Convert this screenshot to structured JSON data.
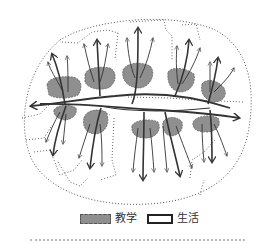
{
  "diagram": {
    "type": "campus-zoning-flow-diagram",
    "colors": {
      "teaching_fill": "#8f8f8f",
      "teaching_stroke": "#666666",
      "arrow": "#333333",
      "dotted_boundary": "#555555",
      "background": "#ffffff"
    },
    "outer_boundary": {
      "cx": 136,
      "cy": 112,
      "rx": 114,
      "ry": 94,
      "style": "dotted"
    },
    "teaching_zones": [
      {
        "id": "upper-1",
        "cx": 63,
        "cy": 87,
        "rx": 17,
        "ry": 10
      },
      {
        "id": "upper-2",
        "cx": 100,
        "cy": 77,
        "rx": 16,
        "ry": 11
      },
      {
        "id": "upper-3",
        "cx": 137,
        "cy": 75,
        "rx": 15,
        "ry": 12
      },
      {
        "id": "upper-4",
        "cx": 180,
        "cy": 80,
        "rx": 14,
        "ry": 12
      },
      {
        "id": "upper-5",
        "cx": 213,
        "cy": 91,
        "rx": 12,
        "ry": 11
      },
      {
        "id": "lower-1",
        "cx": 65,
        "cy": 112,
        "rx": 12,
        "ry": 7
      },
      {
        "id": "lower-2",
        "cx": 95,
        "cy": 122,
        "rx": 13,
        "ry": 11
      },
      {
        "id": "lower-3",
        "cx": 145,
        "cy": 129,
        "rx": 14,
        "ry": 9
      },
      {
        "id": "lower-4",
        "cx": 172,
        "cy": 126,
        "rx": 10,
        "ry": 9
      },
      {
        "id": "lower-5",
        "cx": 207,
        "cy": 124,
        "rx": 13,
        "ry": 8
      }
    ],
    "main_axis_arrows": [
      {
        "direction": "west",
        "head": [
          30,
          107
        ]
      },
      {
        "direction": "east",
        "head": [
          240,
          118
        ]
      }
    ]
  },
  "legend": {
    "items": [
      {
        "key": "teaching",
        "label": "教学",
        "swatch": "gray-dashed-fill"
      },
      {
        "key": "living",
        "label": "生活",
        "swatch": "white-solid-outline"
      }
    ]
  }
}
